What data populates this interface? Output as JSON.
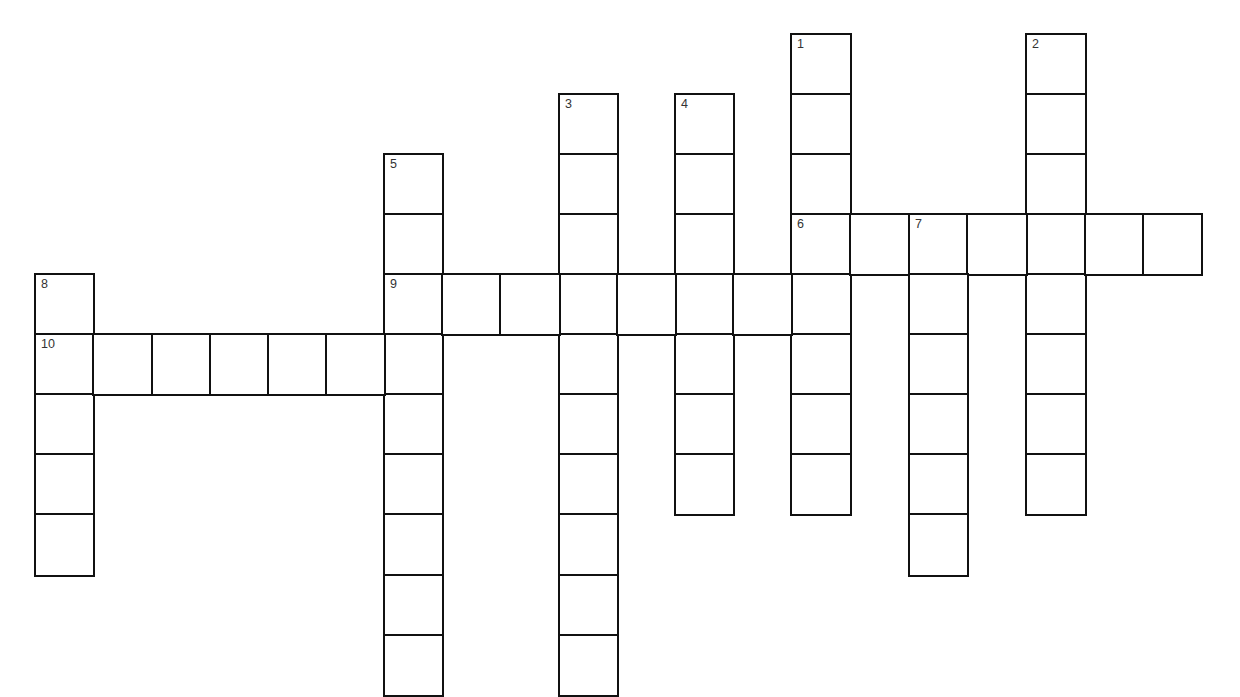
{
  "puzzle": {
    "type": "crossword",
    "colors": {
      "background": "#ffffff",
      "grid_line": "#111111",
      "number_text": "#333333"
    },
    "grid": {
      "col_edges": [
        35,
        93,
        152,
        210,
        268,
        326,
        384,
        442,
        500,
        559,
        617,
        675,
        733,
        791,
        850,
        909,
        967,
        1026,
        1085,
        1143,
        1201
      ],
      "row_edges": [
        34,
        94,
        154,
        214,
        274,
        334,
        394,
        454,
        514,
        575,
        635,
        695
      ]
    },
    "entries": [
      {
        "number": "1",
        "direction": "down",
        "row": 0,
        "col": 13,
        "length": 8
      },
      {
        "number": "2",
        "direction": "down",
        "row": 0,
        "col": 17,
        "length": 8
      },
      {
        "number": "3",
        "direction": "down",
        "row": 1,
        "col": 9,
        "length": 10
      },
      {
        "number": "4",
        "direction": "down",
        "row": 1,
        "col": 11,
        "length": 7
      },
      {
        "number": "5",
        "direction": "down",
        "row": 2,
        "col": 6,
        "length": 9
      },
      {
        "number": "6",
        "direction": "across",
        "row": 3,
        "col": 13,
        "length": 7
      },
      {
        "number": "7",
        "direction": "down",
        "row": 3,
        "col": 15,
        "length": 6
      },
      {
        "number": "8",
        "direction": "down",
        "row": 4,
        "col": 0,
        "length": 5
      },
      {
        "number": "9",
        "direction": "across",
        "row": 4,
        "col": 6,
        "length": 8
      },
      {
        "number": "10",
        "direction": "across",
        "row": 5,
        "col": 0,
        "length": 7
      }
    ]
  }
}
